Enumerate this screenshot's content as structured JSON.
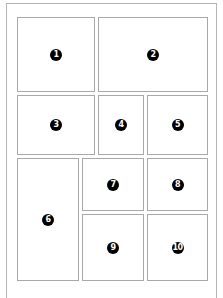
{
  "layout": {
    "title": "",
    "panels": [
      {
        "number": "1",
        "x": 17,
        "y": 17,
        "w": 78,
        "h": 75
      },
      {
        "number": "2",
        "x": 98,
        "y": 17,
        "w": 110,
        "h": 75
      },
      {
        "number": "3",
        "x": 17,
        "y": 95,
        "w": 78,
        "h": 60
      },
      {
        "number": "4",
        "x": 98,
        "y": 95,
        "w": 46,
        "h": 60
      },
      {
        "number": "5",
        "x": 147,
        "y": 95,
        "w": 61,
        "h": 60
      },
      {
        "number": "6",
        "x": 17,
        "y": 158,
        "w": 62,
        "h": 123
      },
      {
        "number": "7",
        "x": 82,
        "y": 158,
        "w": 62,
        "h": 53
      },
      {
        "number": "8",
        "x": 147,
        "y": 158,
        "w": 61,
        "h": 53
      },
      {
        "number": "9",
        "x": 82,
        "y": 214,
        "w": 62,
        "h": 67
      },
      {
        "number": "10",
        "x": 147,
        "y": 214,
        "w": 61,
        "h": 67
      }
    ]
  },
  "colors": {
    "border": "#a8a8a8",
    "badge_bg": "#000000",
    "badge_text": "#ffffff"
  }
}
